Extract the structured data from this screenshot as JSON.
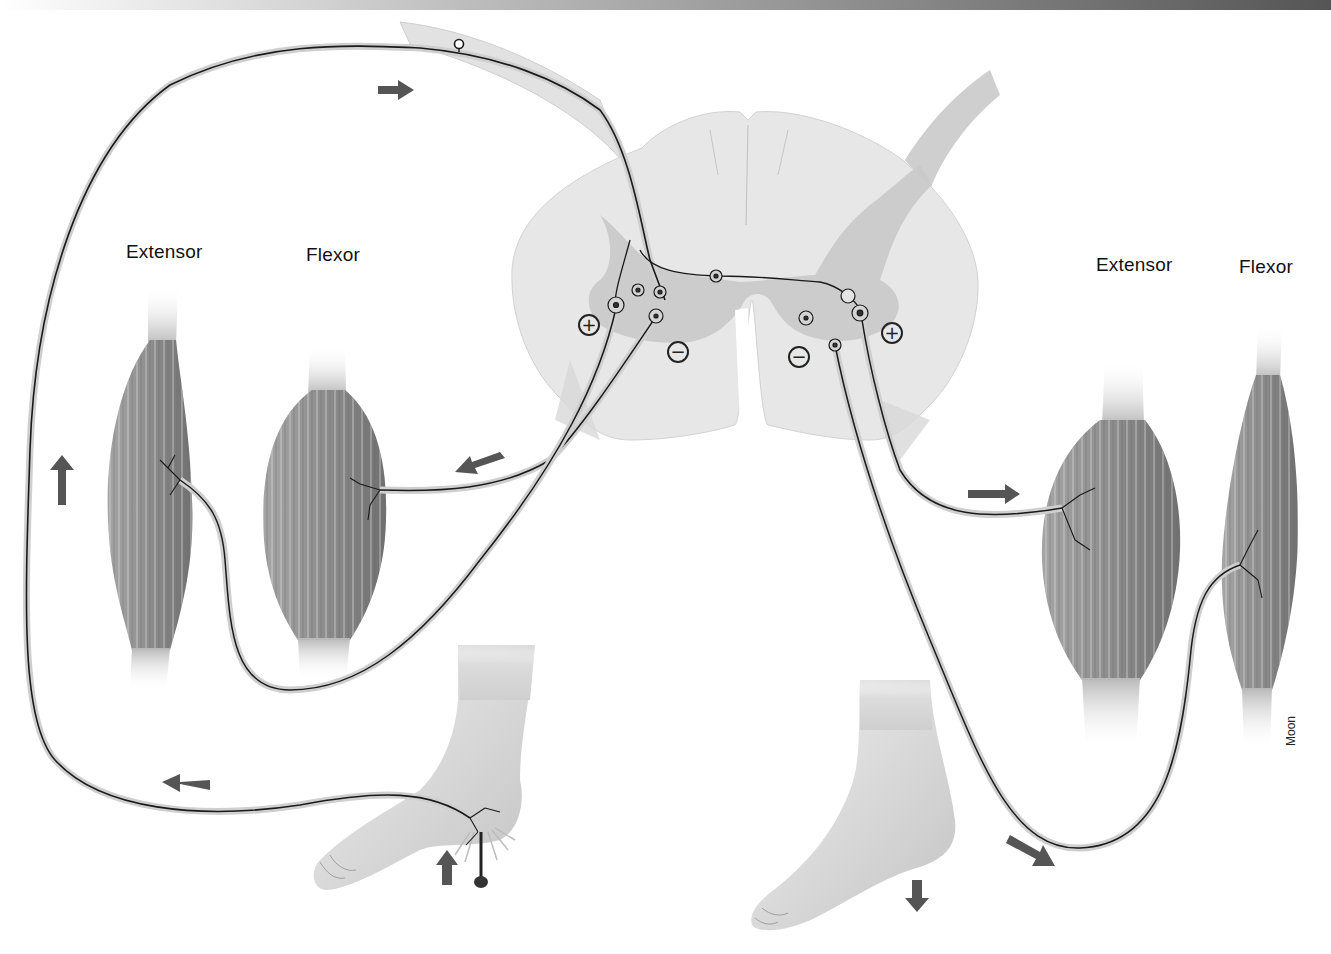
{
  "diagram": {
    "type": "crossed-extensor-reflex",
    "left_side": {
      "extensor_label": "Extensor",
      "flexor_label": "Flexor",
      "stimulated_foot": "lifted",
      "motor_signs": {
        "extensor": "+",
        "flexor": "−"
      }
    },
    "right_side": {
      "extensor_label": "Extensor",
      "flexor_label": "Flexor",
      "opposite_foot": "planted",
      "motor_signs": {
        "extensor": "+",
        "flexor": "−"
      }
    },
    "signs": {
      "left_plus": "+",
      "left_minus": "−",
      "right_minus": "−",
      "right_plus": "+"
    },
    "credit": "Moon",
    "colors": {
      "spinal_white_matter": "#e6e6e6",
      "spinal_gray_matter": "#c8c8c8",
      "muscle": "#8a8a8a",
      "nerve": "#1a1a1a",
      "arrow": "#555555",
      "skin": "#d9d9d9"
    }
  }
}
